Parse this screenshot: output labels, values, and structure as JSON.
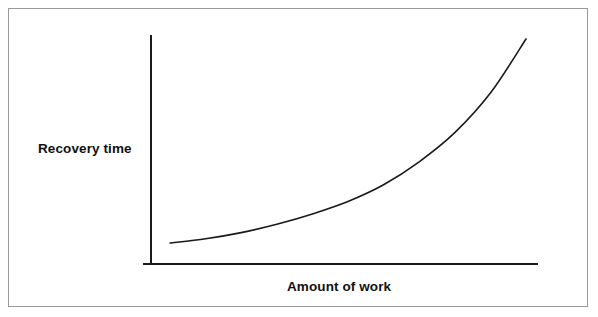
{
  "figure": {
    "background_color": "#ffffff",
    "border_color": "#9a9a9a",
    "line_color": "#1a1a1a",
    "text_color": "#111111"
  },
  "labels": {
    "y_axis": "Recovery time",
    "x_axis": "Amount of work"
  },
  "chart_data": {
    "type": "line",
    "title": "",
    "subtitle": "",
    "xlabel": "Amount of work",
    "ylabel": "Recovery time",
    "xlim": [
      0,
      1
    ],
    "ylim": [
      0,
      1
    ],
    "grid": false,
    "legend": null,
    "axis_ticks": {
      "x": [],
      "y": []
    },
    "annotations": [],
    "series": [
      {
        "name": "Recovery time vs amount of work",
        "shape": "exponential-increasing",
        "x": [
          0.0,
          0.1,
          0.2,
          0.3,
          0.4,
          0.5,
          0.6,
          0.7,
          0.8,
          0.9,
          1.0
        ],
        "y": [
          0.02,
          0.04,
          0.07,
          0.11,
          0.16,
          0.22,
          0.3,
          0.41,
          0.55,
          0.74,
          1.0
        ]
      }
    ]
  }
}
